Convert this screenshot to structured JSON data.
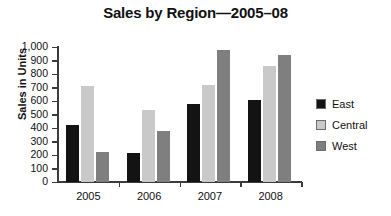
{
  "chart_data": {
    "type": "bar",
    "title": "Sales by Region—2005–08",
    "xlabel": "",
    "ylabel": "Sales in Units",
    "categories": [
      "2005",
      "2006",
      "2007",
      "2008"
    ],
    "ylim": [
      0,
      1000
    ],
    "ytick_values": [
      0,
      100,
      200,
      300,
      400,
      500,
      600,
      700,
      800,
      900,
      1000
    ],
    "ytick_labels": [
      "0",
      "100",
      "200",
      "300",
      "400",
      "500",
      "600",
      "700",
      "800",
      "900",
      "1,000"
    ],
    "grid": false,
    "legend_position": "right",
    "series": [
      {
        "name": "East",
        "color": "#131313",
        "values": [
          420,
          215,
          575,
          610
        ]
      },
      {
        "name": "Central",
        "color": "#c9c9c9",
        "values": [
          710,
          530,
          715,
          860
        ]
      },
      {
        "name": "West",
        "color": "#7f7f7f",
        "values": [
          225,
          375,
          980,
          940
        ]
      }
    ]
  }
}
